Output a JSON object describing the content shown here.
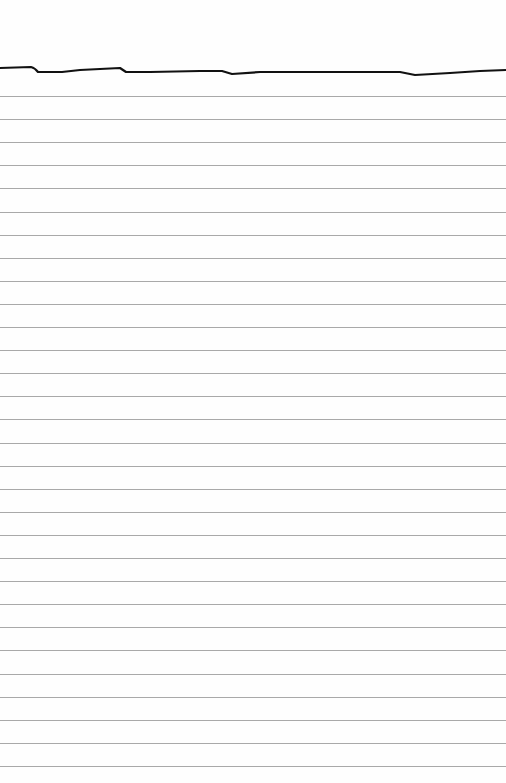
{
  "page": {
    "type": "lined-paper",
    "background_color": "#fefefe",
    "top_line_color": "#111111",
    "rule_color": "#a9a9a9",
    "first_rule_y": 96,
    "rule_spacing": 23.1,
    "rule_count": 30
  }
}
